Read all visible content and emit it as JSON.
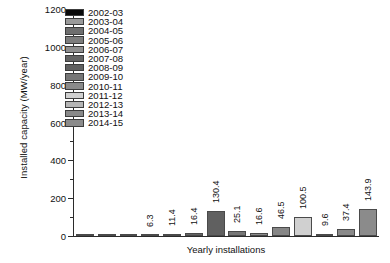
{
  "chart_data": {
    "type": "bar",
    "title": "",
    "xlabel": "Yearly installations",
    "ylabel": "Installed capacity (MW/year)",
    "ylim": [
      0,
      1200
    ],
    "ytick_labels": [
      "0",
      "200",
      "400",
      "600",
      "800",
      "1000",
      "1200"
    ],
    "ytick_values": [
      0,
      200,
      400,
      600,
      800,
      1000,
      1200
    ],
    "minor_tick_step": 100,
    "grid": false,
    "legend_position": "upper-left-inside",
    "categories": [
      "2002-03",
      "2003-04",
      "2004-05",
      "2005-06",
      "2006-07",
      "2007-08",
      "2008-09",
      "2009-10",
      "2010-11",
      "2011-12",
      "2012-13",
      "2013-14",
      "2014-15"
    ],
    "values": [
      0.0,
      0.0,
      0.0,
      6.3,
      11.4,
      16.4,
      130.4,
      25.1,
      16.6,
      46.5,
      100.5,
      9.6,
      37.4
    ],
    "value_labels": [
      "",
      "",
      "",
      "6.3",
      "11.4",
      "16.4",
      "130.4",
      "25.1",
      "16.6",
      "46.5",
      "100.5",
      "9.6",
      "37.4"
    ],
    "bars": [
      {
        "label": "2002-03",
        "value": 0.0,
        "value_label": "",
        "color": "#0a0a0a"
      },
      {
        "label": "2003-04",
        "value": 0.0,
        "value_label": "",
        "color": "#9a9a9a"
      },
      {
        "label": "2004-05",
        "value": 0.0,
        "value_label": "",
        "color": "#6e6e6e"
      },
      {
        "label": "2005-06",
        "value": 6.3,
        "value_label": "6.3",
        "color": "#7d7d7d"
      },
      {
        "label": "2006-07",
        "value": 11.4,
        "value_label": "11.4",
        "color": "#8f8f8f"
      },
      {
        "label": "2007-08",
        "value": 16.4,
        "value_label": "16.4",
        "color": "#636363"
      },
      {
        "label": "2008-09",
        "value": 130.4,
        "value_label": "130.4",
        "color": "#606060"
      },
      {
        "label": "2009-10",
        "value": 25.1,
        "value_label": "25.1",
        "color": "#767676"
      },
      {
        "label": "2010-11",
        "value": 16.6,
        "value_label": "16.6",
        "color": "#8a8a8a"
      },
      {
        "label": "2011-12",
        "value": 46.5,
        "value_label": "46.5",
        "color": "#868686"
      },
      {
        "label": "2012-13",
        "value": 100.5,
        "value_label": "100.5",
        "color": "#d0d0d0"
      },
      {
        "label": "2013-14",
        "value": 9.6,
        "value_label": "9.6",
        "color": "#b5b5b5"
      },
      {
        "label": "2014-15",
        "value": 37.4,
        "value_label": "37.4",
        "color": "#898989"
      },
      {
        "label": "2014-15-extra",
        "value": 143.9,
        "value_label": "143.9",
        "color": "#8b8b8b"
      }
    ],
    "legend": [
      {
        "label": "2002-03",
        "color": "#0a0a0a"
      },
      {
        "label": "2003-04",
        "color": "#9a9a9a"
      },
      {
        "label": "2004-05",
        "color": "#6e6e6e"
      },
      {
        "label": "2005-06",
        "color": "#7d7d7d"
      },
      {
        "label": "2006-07",
        "color": "#8f8f8f"
      },
      {
        "label": "2007-08",
        "color": "#636363"
      },
      {
        "label": "2008-09",
        "color": "#606060"
      },
      {
        "label": "2009-10",
        "color": "#767676"
      },
      {
        "label": "2010-11",
        "color": "#8a8a8a"
      },
      {
        "label": "2011-12",
        "color": "#d0d0d0"
      },
      {
        "label": "2012-13",
        "color": "#b5b5b5"
      },
      {
        "label": "2013-14",
        "color": "#898989"
      },
      {
        "label": "2014-15",
        "color": "#8b8b8b"
      }
    ],
    "axis_color": "#2b2b2b",
    "background": "#ffffff"
  }
}
